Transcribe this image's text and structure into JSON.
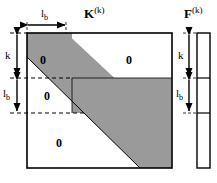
{
  "figure": {
    "type": "matrix-structure-diagram",
    "background": "#ffffff",
    "band_color": "#9a9a9a",
    "line_color": "#000000"
  },
  "matrix_K": {
    "name": "K",
    "superscript": "(k)",
    "zero_blocks": [
      {
        "id": "upper-left",
        "label": "0"
      },
      {
        "id": "middle-left",
        "label": "0"
      },
      {
        "id": "lower-left",
        "label": "0"
      },
      {
        "id": "upper-right",
        "label": "0"
      }
    ],
    "dimensions": {
      "top_width_label": "l",
      "top_width_sub": "b",
      "left_upper_label": "k",
      "left_lower_label": "l",
      "left_lower_sub": "b"
    }
  },
  "vector_F": {
    "name": "F",
    "superscript": "(k)",
    "dimensions": {
      "upper_label": "k",
      "lower_label": "l",
      "lower_sub": "b"
    }
  }
}
